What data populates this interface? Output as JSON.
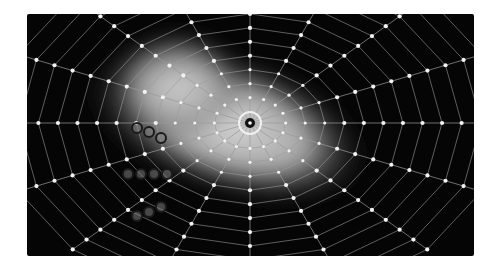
{
  "image": {
    "description": "Grayscale rendering of a radial spiderweb-like grid with a bright gradient blob, dot nodes along polygonal rings, and dark circular markers",
    "background_color": "#050505",
    "line_color": "#9a9a9a",
    "node_color": "#f2f2f2",
    "marker_stroke": "#1a1a1a",
    "marker_fill": "#8a8a8a",
    "center": {
      "x": 223,
      "y": 109
    },
    "spokes": 16,
    "rings": 12,
    "markers": [
      {
        "group": "row-1",
        "points": [
          [
            110,
            114
          ],
          [
            122,
            118
          ],
          [
            134,
            124
          ]
        ]
      },
      {
        "group": "row-2",
        "points": [
          [
            101,
            160
          ],
          [
            114,
            160
          ],
          [
            127,
            160
          ],
          [
            140,
            160
          ]
        ]
      },
      {
        "group": "row-3",
        "points": [
          [
            110,
            202
          ],
          [
            122,
            198
          ],
          [
            134,
            193
          ]
        ]
      }
    ]
  }
}
